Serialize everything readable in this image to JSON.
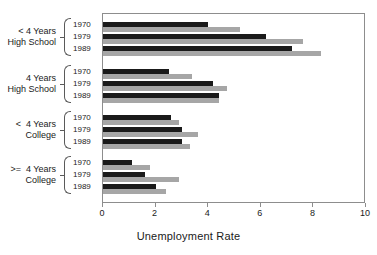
{
  "chart_data": {
    "type": "bar",
    "orientation": "horizontal",
    "title": "",
    "xlabel": "Unemployment Rate",
    "ylabel": "",
    "xlim": [
      0,
      10
    ],
    "xticks": [
      0,
      2,
      4,
      6,
      8,
      10
    ],
    "xticklabels": [
      "0",
      "2",
      "4",
      "6",
      "8",
      "10"
    ],
    "grid": false,
    "legend": "none",
    "series": [
      {
        "name": "dark-series",
        "color": "#1a1a1a"
      },
      {
        "name": "light-series",
        "color": "#a6a6a6"
      }
    ],
    "categories": [
      "< 4 Years High School",
      "4 Years High School",
      "< 4 Years College",
      ">= 4 Years College"
    ],
    "subcategories": [
      "1970",
      "1979",
      "1989"
    ],
    "groups": [
      {
        "label_line1": "< 4 Years",
        "label_line2": "High School",
        "rows": [
          {
            "year": "1970",
            "dark": 4.0,
            "light": 5.2
          },
          {
            "year": "1979",
            "dark": 6.2,
            "light": 7.6
          },
          {
            "year": "1989",
            "dark": 7.2,
            "light": 8.3
          }
        ]
      },
      {
        "label_line1": "4 Years",
        "label_line2": "High School",
        "rows": [
          {
            "year": "1970",
            "dark": 2.5,
            "light": 3.4
          },
          {
            "year": "1979",
            "dark": 4.2,
            "light": 4.7
          },
          {
            "year": "1989",
            "dark": 4.4,
            "light": 4.4
          }
        ]
      },
      {
        "label_line1": "<  4 Years",
        "label_line2": "College",
        "rows": [
          {
            "year": "1970",
            "dark": 2.6,
            "light": 2.9
          },
          {
            "year": "1979",
            "dark": 3.0,
            "light": 3.6
          },
          {
            "year": "1989",
            "dark": 3.0,
            "light": 3.3
          }
        ]
      },
      {
        "label_line1": ">=  4 Years",
        "label_line2": "College",
        "rows": [
          {
            "year": "1970",
            "dark": 1.1,
            "light": 1.8
          },
          {
            "year": "1979",
            "dark": 1.6,
            "light": 2.9
          },
          {
            "year": "1989",
            "dark": 2.0,
            "light": 2.4
          }
        ]
      }
    ]
  },
  "axis": {
    "title": "Unemployment Rate"
  }
}
